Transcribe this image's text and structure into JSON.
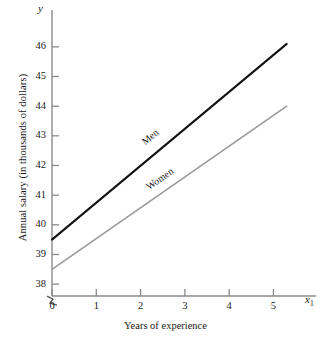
{
  "chart_data": {
    "type": "line",
    "title": "",
    "xlabel": "Years of experience",
    "ylabel": "Annual salary (in thousands of dollars)",
    "x_axis_variable": "x",
    "x_axis_variable_subscript": "1",
    "y_axis_variable": "y",
    "xlim": [
      0,
      5.6
    ],
    "ylim": [
      37.6,
      46.5
    ],
    "xticks": [
      0,
      1,
      2,
      3,
      4,
      5
    ],
    "xtick_labels": [
      "0",
      "1",
      "2",
      "3",
      "4",
      "5"
    ],
    "yticks": [
      38,
      39,
      40,
      41,
      42,
      43,
      44,
      45,
      46
    ],
    "ytick_labels": [
      "38",
      "39",
      "40",
      "41",
      "42",
      "43",
      "44",
      "45",
      "46"
    ],
    "grid": false,
    "legend_position": "inline-on-line",
    "y_axis_break": true,
    "y_axis_break_symbol": "zigzag",
    "series": [
      {
        "name": "Men",
        "color": "#111111",
        "width": 2.0,
        "x": [
          0,
          5.3
        ],
        "values": [
          39.5,
          46.1
        ],
        "intercept": 39.5,
        "slope": 1.245,
        "label": "Men",
        "label_x": 2.05,
        "label_y": 42.95
      },
      {
        "name": "Women",
        "color": "#9a9a9a",
        "width": 1.6,
        "x": [
          0,
          5.3
        ],
        "values": [
          38.5,
          44.0
        ],
        "intercept": 38.5,
        "slope": 1.038,
        "label": "Women",
        "label_x": 2.15,
        "label_y": 41.45
      }
    ]
  },
  "axes": {
    "line_color": "#8a8a8a",
    "tick_color": "#8a8a8a"
  }
}
